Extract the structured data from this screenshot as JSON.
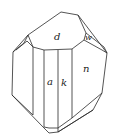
{
  "diagram": {
    "type": "crystal-drawing",
    "faces": [
      {
        "id": "d",
        "label": "d"
      },
      {
        "id": "w",
        "label": "w"
      },
      {
        "id": "a",
        "label": "a"
      },
      {
        "id": "k",
        "label": "k"
      },
      {
        "id": "n",
        "label": "n"
      }
    ],
    "colors": {
      "line": "#2a2a2a",
      "background": "#ffffff"
    }
  }
}
